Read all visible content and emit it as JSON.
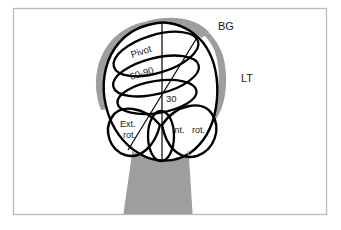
{
  "figure": {
    "kind": "anatomical-diagram",
    "background_color": "#ffffff",
    "frame_color": "#b9b9b9",
    "bone_fill": "#ffffff",
    "bone_outline_color": "#000000",
    "shading_color": "#9e9e9e",
    "label_color": "#1a1a1a"
  },
  "labels": {
    "bg": "BG",
    "lt": "LT",
    "pivot": "Pivot",
    "range_60_90": "60-90",
    "range_30": "30",
    "ext_rot_line1": "Ext.",
    "ext_rot_line2": "rot.",
    "int_rot_line1": "Int.",
    "int_rot_line2": "rot."
  },
  "regions": [
    {
      "name": "pivot-zone",
      "label": "Pivot"
    },
    {
      "name": "sixty-ninety-zone",
      "label": "60-90"
    },
    {
      "name": "thirty-zone",
      "label": "30"
    },
    {
      "name": "external-rotation-lobe",
      "label": "Ext. rot."
    },
    {
      "name": "internal-rotation-lobe",
      "label": "Int. rot."
    },
    {
      "name": "bicipital-groove",
      "label": "BG"
    },
    {
      "name": "lesser-tuberosity",
      "label": "LT"
    }
  ]
}
